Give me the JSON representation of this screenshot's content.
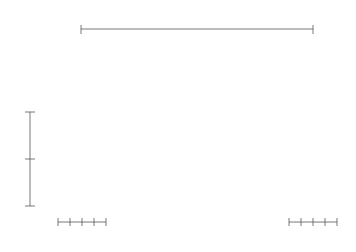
{
  "diagram": {
    "type": "truss-arch-structure",
    "labels": {
      "span": "L",
      "height_upper": "H",
      "height_lower": "H",
      "width_labels": [
        "W",
        "W",
        "W",
        "W"
      ]
    },
    "colors": {
      "member": "#4a4a4a",
      "dimension": "#555555",
      "background": "#ffffff"
    },
    "components": {
      "arch": "curved truss arch with Warren-type web bracing",
      "left_tower": "2-storey braced tower, 2 bays, 3 pinned supports",
      "right_tower": "2-storey braced tower, 2 bays, 3 pinned supports"
    }
  }
}
